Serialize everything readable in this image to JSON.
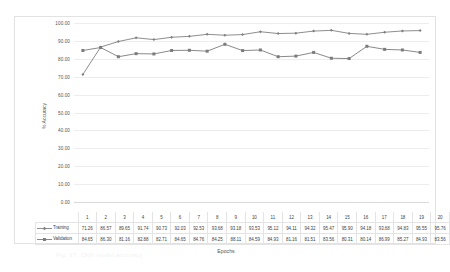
{
  "chart_data": {
    "type": "line",
    "title": "",
    "xlabel": "Epochs",
    "ylabel": "% Accuracy",
    "ylim": [
      0,
      100
    ],
    "ytick_labels": [
      "100.00",
      "90.00",
      "80.00",
      "70.00",
      "60.00",
      "50.00",
      "40.00",
      "30.00",
      "20.00",
      "10.00",
      "0.00"
    ],
    "ytick_values": [
      100,
      90,
      80,
      70,
      60,
      50,
      40,
      30,
      20,
      10,
      0
    ],
    "grid": true,
    "legend_position": "data-table",
    "categories": [
      "1",
      "2",
      "3",
      "4",
      "5",
      "6",
      "7",
      "8",
      "9",
      "10",
      "11",
      "12",
      "13",
      "14",
      "15",
      "16",
      "17",
      "18",
      "19",
      "20"
    ],
    "series": [
      {
        "name": "Training",
        "color": "#808080",
        "marker": "diamond",
        "values": [
          71.26,
          86.57,
          89.65,
          91.74,
          90.73,
          92.03,
          92.53,
          93.68,
          93.18,
          93.53,
          95.12,
          94.11,
          94.32,
          95.47,
          95.9,
          94.18,
          93.68,
          94.83,
          95.55,
          95.76
        ],
        "labels": [
          "71.26",
          "86.57",
          "89.65",
          "91.74",
          "90.73",
          "92.03",
          "92.53",
          "93.68",
          "93.18",
          "93.53",
          "95.12",
          "94.11",
          "94.32",
          "95.47",
          "95.90",
          "94.18",
          "93.68",
          "94.83",
          "95.55",
          "95.76"
        ]
      },
      {
        "name": "Validation",
        "color": "#7c7c7c",
        "marker": "square",
        "values": [
          84.65,
          86.3,
          81.16,
          82.88,
          82.71,
          84.65,
          84.76,
          84.25,
          88.11,
          84.59,
          84.93,
          81.16,
          81.51,
          83.56,
          80.31,
          80.14,
          86.99,
          85.27,
          84.93,
          83.56
        ],
        "labels": [
          "84.65",
          "86.30",
          "81.16",
          "82.88",
          "82.71",
          "84.65",
          "84.76",
          "84.25",
          "88.11",
          "84.59",
          "84.93",
          "81.16",
          "81.51",
          "83.56",
          "80.31",
          "80.14",
          "86.99",
          "85.27",
          "84.93",
          "83.56"
        ]
      }
    ]
  },
  "figure": {
    "caption": "Fig. 17.  CNN model accuracy"
  }
}
